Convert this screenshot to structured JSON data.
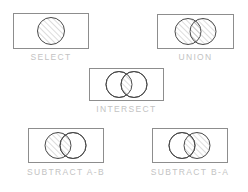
{
  "diagram": {
    "style": {
      "box_stroke": "#8d8d8d",
      "circle_stroke": "#4a4a4a",
      "hatch_color": "#9a9a9a",
      "label_color": "#c3c3c3",
      "background": "#ffffff",
      "hatch_direction": "forward-slash"
    },
    "operations": [
      {
        "id": "select",
        "label": "SELECT",
        "shape_count": 1,
        "hatched_regions": [
          "circle-a"
        ],
        "description": "Single circle fully hatched"
      },
      {
        "id": "union",
        "label": "UNION",
        "shape_count": 2,
        "hatched_regions": [
          "circle-a",
          "circle-b",
          "intersection"
        ],
        "description": "Both overlapping circles fully hatched"
      },
      {
        "id": "intersect",
        "label": "INTERSECT",
        "shape_count": 2,
        "hatched_regions": [
          "intersection"
        ],
        "description": "Only the overlapping lens region is hatched"
      },
      {
        "id": "subtract-ab",
        "label": "SUBTRACT A-B",
        "shape_count": 2,
        "hatched_regions": [
          "circle-a"
        ],
        "description": "Left circle hatched, right circle clear"
      },
      {
        "id": "subtract-ba",
        "label": "SUBTRACT B-A",
        "shape_count": 2,
        "hatched_regions": [
          "circle-b"
        ],
        "description": "Right circle hatched, left circle clear"
      }
    ]
  }
}
